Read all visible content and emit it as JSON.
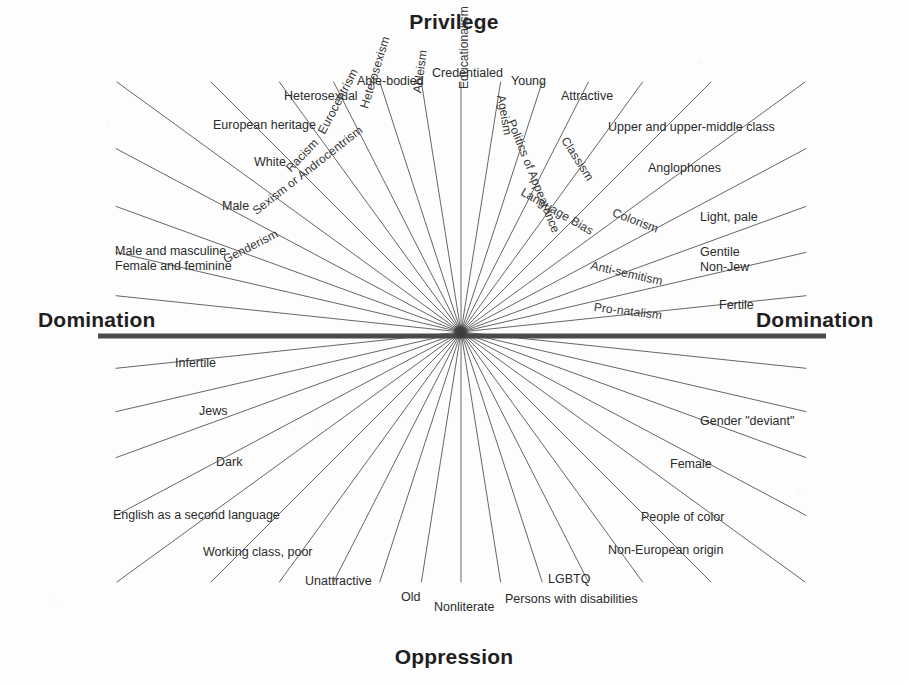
{
  "figure": {
    "top_title": "Privilege",
    "bottom_title": "Oppression",
    "left_title": "Domination",
    "right_title": "Domination"
  },
  "chart_data": {
    "type": "radial-diagram",
    "center": [
      461,
      332
    ],
    "axes": {
      "vertical_top": "Privilege",
      "vertical_bottom": "Oppression",
      "horizontal_left": "Domination",
      "horizontal_right": "Domination"
    },
    "spokes": [
      {
        "ism": "Eurocentrism",
        "privileged": "European heritage",
        "oppressed": "Non-European origin"
      },
      {
        "ism": "Heterosexism",
        "privileged": "Heterosexual",
        "oppressed": "LGBTQ"
      },
      {
        "ism": "Ableism",
        "privileged": "Able-bodied",
        "oppressed": "Persons with disabilities"
      },
      {
        "ism": "Educationalism",
        "privileged": "Credentialed",
        "oppressed": "Nonliterate"
      },
      {
        "ism": "Ageism",
        "privileged": "Young",
        "oppressed": "Old"
      },
      {
        "ism": "Politics of Appearance",
        "privileged": "Attractive",
        "oppressed": "Unattractive"
      },
      {
        "ism": "Classism",
        "privileged": "Upper and upper-middle class",
        "oppressed": "Working class, poor"
      },
      {
        "ism": "Language Bias",
        "privileged": "Anglophones",
        "oppressed": "English as a second language"
      },
      {
        "ism": "Colorism",
        "privileged": "Light, pale",
        "oppressed": "Dark"
      },
      {
        "ism": "Anti-semitism",
        "privileged": "Gentile\nNon-Jew",
        "oppressed": "Jews"
      },
      {
        "ism": "Pro-natalism",
        "privileged": "Fertile",
        "oppressed": "Infertile"
      },
      {
        "ism": "Racism",
        "privileged": "White",
        "oppressed": "People of color"
      },
      {
        "ism": "Sexism or Androcentrism",
        "privileged": "Male",
        "oppressed": "Female"
      },
      {
        "ism": "Genderism",
        "privileged": "Male and masculine\nFemale and feminine",
        "oppressed": "Gender \"deviant\""
      }
    ]
  },
  "privilege_labels": [
    {
      "name": "label-european-heritage",
      "text": "European heritage",
      "x": 213,
      "y": 118,
      "rot": 0
    },
    {
      "name": "label-heterosexual",
      "text": "Heterosexual",
      "x": 284,
      "y": 89,
      "rot": 0
    },
    {
      "name": "label-able-bodied",
      "text": "Able-bodied",
      "x": 357,
      "y": 74,
      "rot": 0
    },
    {
      "name": "label-credentialed",
      "text": "Credentialed",
      "x": 432,
      "y": 66,
      "rot": 0
    },
    {
      "name": "label-young",
      "text": "Young",
      "x": 511,
      "y": 74,
      "rot": 0
    },
    {
      "name": "label-attractive",
      "text": "Attractive",
      "x": 561,
      "y": 89,
      "rot": 0
    },
    {
      "name": "label-upper-class",
      "text": "Upper and upper-middle class",
      "x": 608,
      "y": 120,
      "rot": 0
    },
    {
      "name": "label-anglophones",
      "text": "Anglophones",
      "x": 648,
      "y": 161,
      "rot": 0
    },
    {
      "name": "label-light-pale",
      "text": "Light, pale",
      "x": 700,
      "y": 210,
      "rot": 0
    },
    {
      "name": "label-gentile-nonjew",
      "text": "Gentile\nNon-Jew",
      "x": 700,
      "y": 245,
      "rot": 0
    },
    {
      "name": "label-fertile",
      "text": "Fertile",
      "x": 719,
      "y": 298,
      "rot": 0
    },
    {
      "name": "label-white",
      "text": "White",
      "x": 254,
      "y": 155,
      "rot": 0
    },
    {
      "name": "label-male",
      "text": "Male",
      "x": 222,
      "y": 199,
      "rot": 0
    },
    {
      "name": "label-male-female-gender",
      "text": "Male and masculine\nFemale and feminine",
      "x": 115,
      "y": 244,
      "rot": 0
    }
  ],
  "oppression_labels": [
    {
      "name": "label-infertile",
      "text": "Infertile",
      "x": 175,
      "y": 356,
      "rot": 0
    },
    {
      "name": "label-jews",
      "text": "Jews",
      "x": 199,
      "y": 404,
      "rot": 0
    },
    {
      "name": "label-dark",
      "text": "Dark",
      "x": 216,
      "y": 455,
      "rot": 0
    },
    {
      "name": "label-english-second-language",
      "text": "English as a second language",
      "x": 113,
      "y": 508,
      "rot": 0
    },
    {
      "name": "label-working-class-poor",
      "text": "Working class, poor",
      "x": 203,
      "y": 545,
      "rot": 0
    },
    {
      "name": "label-unattractive",
      "text": "Unattractive",
      "x": 305,
      "y": 574,
      "rot": 0
    },
    {
      "name": "label-old",
      "text": "Old",
      "x": 401,
      "y": 590,
      "rot": 0
    },
    {
      "name": "label-nonliterate",
      "text": "Nonliterate",
      "x": 434,
      "y": 600,
      "rot": 0
    },
    {
      "name": "label-persons-with-disabilities",
      "text": "Persons with disabilities",
      "x": 505,
      "y": 592,
      "rot": 0
    },
    {
      "name": "label-lgbtq",
      "text": "LGBTQ",
      "x": 548,
      "y": 572,
      "rot": 0
    },
    {
      "name": "label-non-european-origin",
      "text": "Non-European origin",
      "x": 608,
      "y": 543,
      "rot": 0
    },
    {
      "name": "label-people-of-color",
      "text": "People of color",
      "x": 641,
      "y": 510,
      "rot": 0
    },
    {
      "name": "label-female",
      "text": "Female",
      "x": 670,
      "y": 457,
      "rot": 0
    },
    {
      "name": "label-gender-deviant",
      "text": "Gender \"deviant\"",
      "x": 700,
      "y": 414,
      "rot": 0
    }
  ],
  "spoke_names": [
    {
      "name": "spoke-genderism",
      "text": "Genderism",
      "x": 224,
      "y": 253,
      "rot": 27
    },
    {
      "name": "spoke-sexism",
      "text": "Sexism or Androcentrism",
      "x": 254,
      "y": 205,
      "rot": 38
    },
    {
      "name": "spoke-racism",
      "text": "Racism",
      "x": 288,
      "y": 163,
      "rot": 46
    },
    {
      "name": "spoke-eurocentrism",
      "text": "Eurocentrism",
      "x": 321,
      "y": 126,
      "rot": 62
    },
    {
      "name": "spoke-heterosexism",
      "text": "Heterosexism",
      "x": 364,
      "y": 101,
      "rot": 73
    },
    {
      "name": "spoke-ableism",
      "text": "Ableism",
      "x": 417,
      "y": 86,
      "rot": 82
    },
    {
      "name": "spoke-educationalism",
      "text": "Educationalism",
      "x": 464,
      "y": 82,
      "rot": 90
    },
    {
      "name": "spoke-ageism",
      "text": "Ageism",
      "x": 501,
      "y": 88,
      "rot": -80
    },
    {
      "name": "spoke-politics-appearance",
      "text": "Politics of Appearance",
      "x": 511,
      "y": 113,
      "rot": -68
    },
    {
      "name": "spoke-classism",
      "text": "Classism",
      "x": 564,
      "y": 131,
      "rot": -57
    },
    {
      "name": "spoke-language-bias",
      "text": "Language Bias",
      "x": 522,
      "y": 184,
      "rot": -30
    },
    {
      "name": "spoke-colorism",
      "text": "Colorism",
      "x": 613,
      "y": 205,
      "rot": -21
    },
    {
      "name": "spoke-antisemitism",
      "text": "Anti-semitism",
      "x": 591,
      "y": 258,
      "rot": -13
    },
    {
      "name": "spoke-pro-natalism",
      "text": "Pro-natalism",
      "x": 594,
      "y": 300,
      "rot": -7
    }
  ],
  "geometry": {
    "center_x": 461,
    "center_y": 332,
    "axis_left_x": 98,
    "axis_right_x": 826,
    "axis_y": 336,
    "axis_color": "#4a4a4a",
    "ray_color": "#555555",
    "ray_angles_deg": [
      186,
      193,
      200,
      208,
      216,
      225,
      234,
      243,
      252,
      261,
      270,
      279,
      288,
      297,
      306,
      315,
      324,
      332,
      340,
      347,
      354,
      6,
      13,
      20,
      28,
      36,
      45,
      54,
      63,
      72,
      81,
      90,
      99,
      108,
      117,
      126,
      135,
      144,
      152,
      160,
      167,
      174
    ]
  }
}
